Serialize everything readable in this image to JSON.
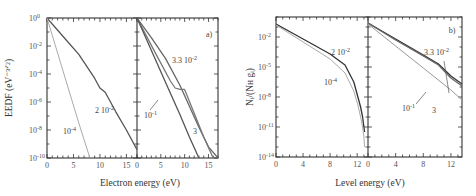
{
  "chart_data": [
    {
      "type": "line",
      "panel_label": "a)",
      "ylabel": "EEDF (eV⁻³ᐟ²)",
      "ylabel_text": "EEDF (eV^-3/2)",
      "xlabel": "Electron energy (eV)",
      "yscale": "log",
      "ylim_exp": [
        -10,
        0
      ],
      "yticks": [
        {
          "exp": 0,
          "label": "10",
          "sup": "0"
        },
        {
          "exp": -2,
          "label": "10",
          "sup": "-2"
        },
        {
          "exp": -4,
          "label": "10",
          "sup": "-4"
        },
        {
          "exp": -6,
          "label": "10",
          "sup": "-6"
        },
        {
          "exp": -8,
          "label": "10",
          "sup": "-8"
        },
        {
          "exp": -10,
          "label": "10",
          "sup": "-10"
        }
      ],
      "subpanels": [
        {
          "xlim": [
            0,
            17
          ],
          "xticks": [
            "0",
            "5",
            "10",
            "15"
          ],
          "xtick_values": [
            0,
            5,
            10,
            15
          ],
          "series": [
            {
              "name": "2 10^-2",
              "color": "#555555",
              "x": [
                0,
                3,
                6,
                9,
                10,
                11,
                13,
                15,
                17
              ],
              "log10_y": [
                0,
                -1.3,
                -2.6,
                -4.3,
                -5.0,
                -5.3,
                -6.7,
                -8.0,
                -9.4
              ]
            },
            {
              "name": "10^-4",
              "color": "#aaaaaa",
              "x": [
                0,
                2,
                4,
                6,
                8.1
              ],
              "log10_y": [
                0,
                -2.5,
                -5.0,
                -7.5,
                -10
              ]
            }
          ],
          "annotations": [
            {
              "text": "2 10",
              "sup": "-2",
              "series": "2 10^-2"
            },
            {
              "text": "10",
              "sup": "-4",
              "series": "10^-4"
            }
          ]
        },
        {
          "xlim": [
            0,
            17
          ],
          "xticks": [
            "0",
            "5",
            "10",
            "15"
          ],
          "xtick_values": [
            0,
            5,
            10,
            15
          ],
          "series": [
            {
              "name": "3.3 10^-2",
              "color": "#666666",
              "x": [
                0,
                3,
                6,
                9,
                11,
                13,
                15,
                17
              ],
              "log10_y": [
                0,
                -1.4,
                -2.9,
                -4.8,
                -6.3,
                -7.8,
                -9.2,
                -10
              ]
            },
            {
              "name": "10^-1",
              "color": "#777777",
              "x": [
                0,
                4,
                7,
                8,
                9,
                10,
                12,
                14,
                16
              ],
              "log10_y": [
                0,
                -2.6,
                -4.5,
                -5.0,
                -5.1,
                -5.1,
                -6.8,
                -8.5,
                -10
              ]
            },
            {
              "name": "3",
              "color": "#555555",
              "x": [
                0,
                3,
                6,
                9,
                11,
                13
              ],
              "log10_y": [
                0,
                -2.3,
                -4.6,
                -6.9,
                -8.5,
                -10
              ]
            }
          ],
          "annotations": [
            {
              "text": "3.3 10",
              "sup": "-2",
              "series": "3.3 10^-2"
            },
            {
              "text": "10",
              "sup": "-1",
              "series": "10^-1"
            },
            {
              "text": "3",
              "sup": "",
              "series": "3"
            }
          ]
        }
      ]
    },
    {
      "type": "line",
      "panel_label": "b)",
      "ylabel": "Nᵢ/(Nʜ gᵢ)",
      "ylabel_text": "N_i/(N_H g_i)",
      "xlabel": "Level energy (eV)",
      "yscale": "log",
      "ylim_exp": [
        -14,
        0
      ],
      "yticks": [
        {
          "exp": -2,
          "label": "10",
          "sup": "-2"
        },
        {
          "exp": -5,
          "label": "10",
          "sup": "-5"
        },
        {
          "exp": -8,
          "label": "10",
          "sup": "-8"
        },
        {
          "exp": -11,
          "label": "10",
          "sup": "-11"
        },
        {
          "exp": -14,
          "label": "10",
          "sup": "-14"
        }
      ],
      "subpanels": [
        {
          "xlim": [
            0,
            13.6
          ],
          "xticks": [
            "0",
            "4",
            "8",
            "12"
          ],
          "xtick_values": [
            0,
            4,
            8,
            12
          ],
          "series": [
            {
              "name": "2 10^-2",
              "color": "#333333",
              "x": [
                0,
                4,
                8,
                10.2,
                11.5,
                12.1,
                12.5,
                12.8,
                13.0,
                13.1
              ],
              "log10_y": [
                -0.7,
                -2.2,
                -3.7,
                -4.8,
                -6.5,
                -8.0,
                -9.0,
                -10.0,
                -11.0,
                -11.5
              ]
            },
            {
              "name": "10^-4",
              "color": "#aaaaaa",
              "x": [
                0,
                4,
                8,
                10.2,
                11.5,
                12.1,
                12.5,
                12.8,
                13.0,
                13.1
              ],
              "log10_y": [
                -0.8,
                -2.5,
                -4.2,
                -5.6,
                -7.4,
                -8.8,
                -10.0,
                -11.0,
                -12.0,
                -13.0
              ]
            }
          ],
          "annotations": [
            {
              "text": "2 10",
              "sup": "-2",
              "series": "2 10^-2"
            },
            {
              "text": "10",
              "sup": "-4",
              "series": "10^-4"
            }
          ]
        },
        {
          "xlim": [
            0,
            13.6
          ],
          "xticks": [
            "0",
            "4",
            "8",
            "12"
          ],
          "xtick_values": [
            0,
            4,
            8,
            12
          ],
          "series": [
            {
              "name": "3.3 10^-2",
              "color": "#333333",
              "x": [
                0,
                4,
                8,
                10.2,
                12,
                13.6
              ],
              "log10_y": [
                -0.6,
                -2.2,
                -3.8,
                -4.7,
                -5.9,
                -6.7
              ]
            },
            {
              "name": "10^-1",
              "color": "#666666",
              "x": [
                0,
                4,
                8,
                10.2,
                12,
                13.6
              ],
              "log10_y": [
                -0.6,
                -2.3,
                -3.9,
                -4.8,
                -6.1,
                -6.9
              ]
            },
            {
              "name": "3",
              "color": "#999999",
              "x": [
                0,
                4,
                8,
                12,
                13.6
              ],
              "log10_y": [
                -0.7,
                -2.9,
                -5.1,
                -7.3,
                -8.3
              ]
            }
          ],
          "annotations": [
            {
              "text": "3.3 10",
              "sup": "-2",
              "series": "3.3 10^-2"
            },
            {
              "text": "10",
              "sup": "-1",
              "series": "10^-1"
            },
            {
              "text": "3",
              "sup": "",
              "series": "3"
            }
          ]
        }
      ]
    }
  ]
}
